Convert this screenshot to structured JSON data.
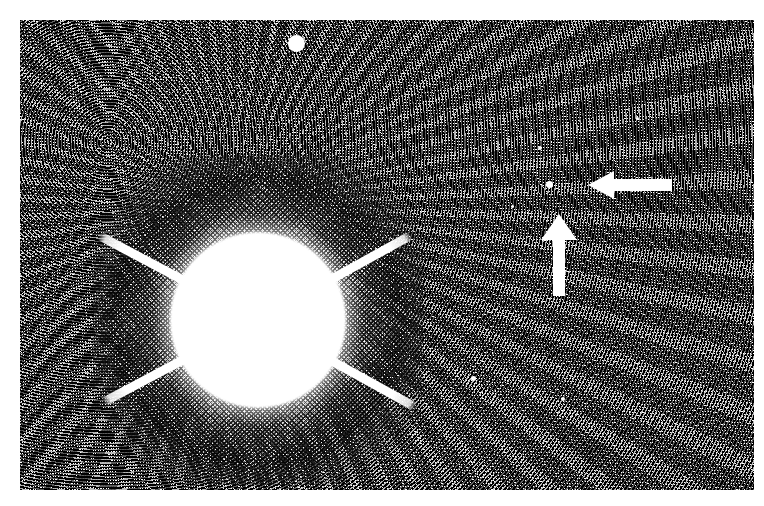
{
  "figure": {
    "kind": "halftone-astronomical-photograph",
    "caption": "",
    "background_color": "#000000",
    "paper_color": "#ffffff",
    "marker_color": "#ffffff"
  },
  "plate": {
    "x": 20,
    "y": 20,
    "width": 734,
    "height": 470,
    "label": "photographic plate"
  },
  "central_star": {
    "label": "bright saturated star",
    "center_x": 258,
    "center_y": 320,
    "core_radius": 88,
    "halo_radius": 165,
    "spike_count": 4,
    "spikes": [
      {
        "label": "upper-left-spike",
        "angle_deg": 208,
        "length": 180
      },
      {
        "label": "upper-right-spike",
        "angle_deg": 331,
        "length": 175
      },
      {
        "label": "lower-left-spike",
        "angle_deg": 152,
        "length": 175
      },
      {
        "label": "lower-right-spike",
        "angle_deg": 29,
        "length": 180
      }
    ]
  },
  "annotations": {
    "left_arrow": {
      "label": "left-pointing arrow",
      "direction": "left",
      "x": 588,
      "y": 170,
      "width": 84,
      "height": 30
    },
    "up_arrow": {
      "label": "up-pointing arrow",
      "direction": "up",
      "x": 540,
      "y": 214,
      "width": 38,
      "height": 82
    },
    "target_object": {
      "label": "faint object indicated by arrows",
      "x": 549,
      "y": 184,
      "size": 7
    }
  },
  "field_objects": [
    {
      "label": "bright-star-top",
      "x": 296,
      "y": 43,
      "size": 17
    },
    {
      "label": "faint-star-lower-mid",
      "x": 473,
      "y": 378,
      "size": 5
    },
    {
      "label": "faint-star-right",
      "x": 540,
      "y": 148,
      "size": 4
    },
    {
      "label": "faint-star-mid",
      "x": 512,
      "y": 206,
      "size": 3
    },
    {
      "label": "faint-star-lower",
      "x": 563,
      "y": 399,
      "size": 4
    },
    {
      "label": "faint-star-upper",
      "x": 637,
      "y": 118,
      "size": 3
    }
  ]
}
